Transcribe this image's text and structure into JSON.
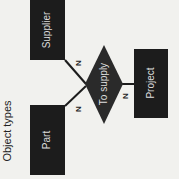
{
  "caption": "Object types",
  "entities": [
    {
      "id": "supplier",
      "label": "Supplier"
    },
    {
      "id": "part",
      "label": "Part"
    },
    {
      "id": "project",
      "label": "Project"
    }
  ],
  "relationship": {
    "label": "To supply"
  },
  "cardinalities": {
    "supplier": "N",
    "part": "N",
    "project": "N"
  },
  "colors": {
    "box": "#1c1c1c",
    "background": "#f1f1ee",
    "line": "#1c1c1c",
    "label": "#dddddd"
  }
}
